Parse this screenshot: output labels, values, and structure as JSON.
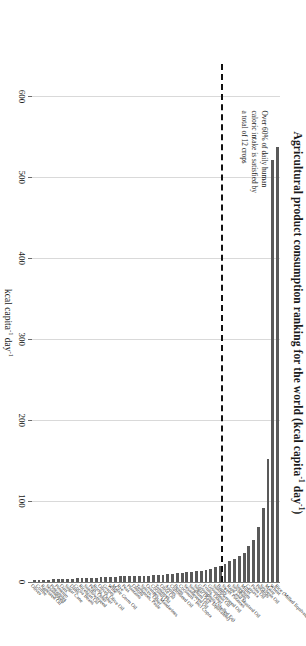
{
  "chart_data": {
    "type": "bar",
    "orientation": "horizontal",
    "title_main": "Agricultural product consumption ranking for the world (kcal capita",
    "title_sup1": "-1",
    "title_mid": " day",
    "title_sup2": "-1",
    "title_end": ")",
    "xlabel": "kcal capita⁻¹ day⁻¹",
    "xlabel_main": "kcal capita",
    "xlabel_sup1": "-1",
    "xlabel_mid": " day",
    "xlabel_sup2": "-1",
    "ylabel": "",
    "xlim": [
      0,
      640
    ],
    "tick_values": [
      600,
      500,
      400,
      300,
      200,
      100,
      0
    ],
    "tick_labels": [
      "600",
      "500",
      "400",
      "300",
      "200",
      "100",
      "0"
    ],
    "axis_direction": "reversed",
    "grid": true,
    "legend": "none",
    "bar_color": "#595959",
    "threshold": {
      "after_category_index": 11,
      "style": "dashed",
      "color": "#111111",
      "label": "12-crop cutoff"
    },
    "annotation": {
      "line1": "Over 60% of daily human",
      "line2": "caloric intake is satisfied by",
      "line3": "a total of 12 crops"
    },
    "categories": [
      "Rice (Milled Equivalent)",
      "Wheat",
      "Maize",
      "Soybean Oil",
      "Potatoes",
      "Palm Oil",
      "Cassava",
      "Millet",
      "Sorghum",
      "Soybeans",
      "Rape and Mustard Oil",
      "Sweet Potatoes",
      "Barley",
      "Sunflowerseed Oil",
      "Groundnut Oil",
      "Fruits, Other",
      "Groundnuts (Shelled Eq)",
      "Sugar (Raw Equivalent)",
      "Sorghum Oil",
      "Sesameseed Oil",
      "Coconuts - Incl Copra",
      "Beans",
      "Cottonseed Oil",
      "Apples",
      "Olive Oil",
      "Tomatoes",
      "Coconut Oil",
      "Oranges, Mandarines",
      "Spices, Other",
      "Tomatoes, Paste",
      "Onions",
      "Plantains",
      "Peas",
      "Rye",
      "Maize Germ Oil",
      "Wine",
      "Grapes",
      "Olives, Olive Oil",
      "Roots, Other",
      "Peas, Other",
      "Sunflowerseed",
      "Ricebran Oil",
      "Cocoa Beans",
      "Dates",
      "Sugar Cane",
      "Oats",
      "Pimento",
      "Pineapples",
      "Sesameseed",
      "Rapeseed Oil",
      "Coffee",
      "Olives"
    ],
    "values": [
      538,
      522,
      152,
      92,
      68,
      52,
      44,
      36,
      32,
      29,
      26,
      22,
      20,
      18,
      16,
      15,
      14,
      13,
      12,
      12,
      11,
      11,
      10,
      10,
      9,
      9,
      9,
      8,
      8,
      8,
      7,
      7,
      7,
      7,
      6,
      6,
      6,
      6,
      5,
      5,
      5,
      5,
      5,
      4,
      4,
      4,
      4,
      4,
      3,
      3,
      3,
      3
    ]
  }
}
